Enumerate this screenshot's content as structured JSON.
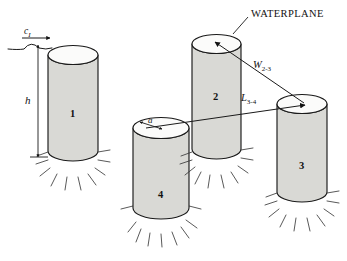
{
  "figure": {
    "type": "engineering-diagram",
    "background_color": "#ffffff",
    "cylinder_side_color": "#d9d9d5",
    "cylinder_top_color": "#fbfbfa",
    "outline_color": "#1a1a1a"
  },
  "annotations": {
    "waterplane_label": "WATERPLANE",
    "wave_celerity_symbol": "c",
    "wave_celerity_subscript": "I",
    "draft_symbol": "h",
    "radius_symbol": "a",
    "spacing_w_symbol": "W",
    "spacing_w_subscript": "2-3",
    "spacing_l_symbol": "L",
    "spacing_l_subscript": "3-4"
  },
  "cylinders": [
    {
      "id": "1",
      "label": "1"
    },
    {
      "id": "2",
      "label": "2"
    },
    {
      "id": "3",
      "label": "3"
    },
    {
      "id": "4",
      "label": "4"
    }
  ]
}
